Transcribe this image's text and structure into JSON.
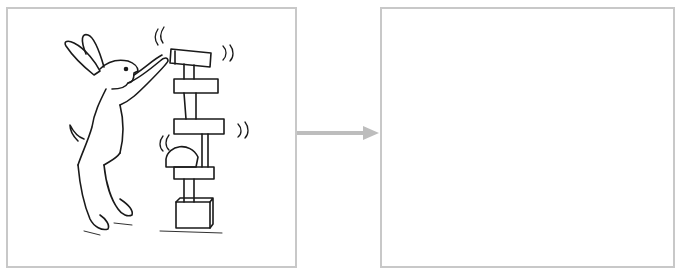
{
  "diagram": {
    "type": "before-after transformation",
    "left_panel": {
      "content": "line drawing of a rabbit stacking a wobbly tower of wooden blocks",
      "elements": [
        "rabbit",
        "block-tower",
        "wobble-marks"
      ]
    },
    "arrow": {
      "direction": "right",
      "color": "#bdbdbd"
    },
    "right_panel": {
      "content": "empty"
    },
    "colors": {
      "border": "#c8c8c8",
      "ink": "#1a1a1a",
      "background": "#ffffff"
    }
  }
}
